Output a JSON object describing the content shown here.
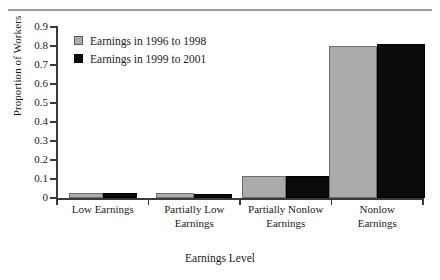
{
  "figure": {
    "background": "#ffffff",
    "has_top_rule": true
  },
  "chart_data": {
    "type": "bar",
    "title": "",
    "xlabel": "Earnings Level",
    "ylabel": "Proportion of Workers",
    "categories": [
      "Low Earnings",
      "Partially Low Earnings",
      "Partially Nonlow Earnings",
      "Nonlow Earnings"
    ],
    "category_lines": [
      [
        "Low Earnings"
      ],
      [
        "Partially Low",
        "Earnings"
      ],
      [
        "Partially Nonlow",
        "Earnings"
      ],
      [
        "Nonlow",
        "Earnings"
      ]
    ],
    "series": [
      {
        "name": "Earnings in 1996 to 1998",
        "color": "#ababab",
        "values": [
          0.025,
          0.025,
          0.115,
          0.8
        ]
      },
      {
        "name": "Earnings in 1999 to 2001",
        "color": "#0b0b0b",
        "values": [
          0.025,
          0.022,
          0.115,
          0.81
        ]
      }
    ],
    "ylim": [
      0,
      0.9
    ],
    "ytick_values": [
      0,
      0.1,
      0.2,
      0.3,
      0.4,
      0.5,
      0.6,
      0.7,
      0.8,
      0.9
    ],
    "ytick_labels": [
      "0",
      "0.1",
      "0.2",
      "0.3",
      "0.4",
      "0.5",
      "0.6",
      "0.7",
      "0.8",
      "0.9"
    ],
    "grid": false,
    "legend_position": "top-left-inside"
  },
  "legend": {
    "entries": [
      {
        "label": "Earnings in 1996 to 1998",
        "swatch": "gray"
      },
      {
        "label": "Earnings in 1999 to 2001",
        "swatch": "black"
      }
    ]
  }
}
